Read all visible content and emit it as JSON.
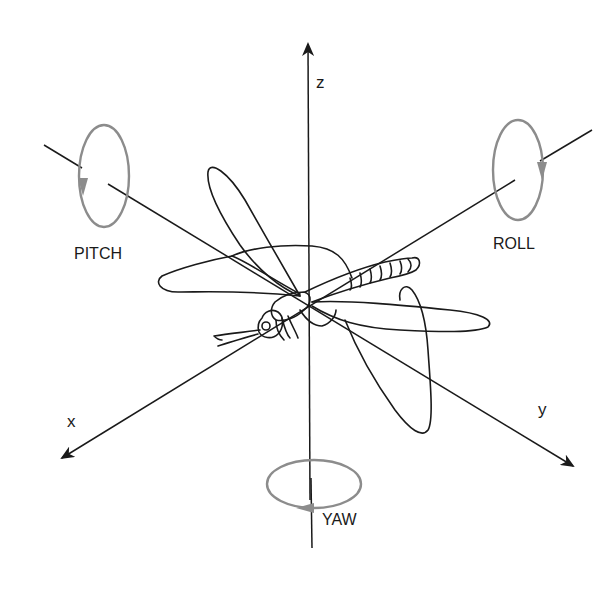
{
  "figure": {
    "colors": {
      "axis": "#1a1a1a",
      "rotation": "#8c8c8c",
      "outline": "#1a1a1a",
      "background": "#ffffff"
    }
  },
  "axes": {
    "x": {
      "label": "x"
    },
    "y": {
      "label": "y"
    },
    "z": {
      "label": "z"
    }
  },
  "rotations": {
    "pitch": {
      "label": "PITCH"
    },
    "roll": {
      "label": "ROLL"
    },
    "yaw": {
      "label": "YAW"
    }
  }
}
